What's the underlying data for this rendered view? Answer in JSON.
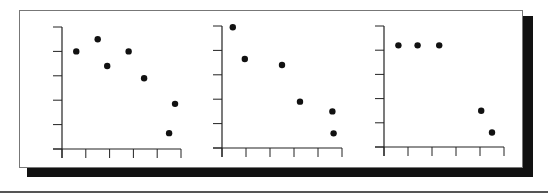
{
  "chart_data": [
    {
      "type": "scatter",
      "title": "",
      "xlabel": "",
      "ylabel": "",
      "xlim": [
        0,
        5
      ],
      "ylim": [
        0,
        5
      ],
      "x_ticks": [
        0,
        1,
        2,
        3,
        4,
        5
      ],
      "y_ticks": [
        0,
        1,
        2,
        3,
        4,
        5
      ],
      "tick_labels_shown": false,
      "grid": false,
      "points": [
        {
          "x": 0.6,
          "y": 4.0
        },
        {
          "x": 1.5,
          "y": 4.5
        },
        {
          "x": 1.9,
          "y": 3.4
        },
        {
          "x": 2.8,
          "y": 4.0
        },
        {
          "x": 3.45,
          "y": 2.9
        },
        {
          "x": 4.75,
          "y": 1.85
        },
        {
          "x": 4.5,
          "y": 0.65
        }
      ]
    },
    {
      "type": "scatter",
      "title": "",
      "xlabel": "",
      "ylabel": "",
      "xlim": [
        0,
        5
      ],
      "ylim": [
        0,
        5
      ],
      "x_ticks": [
        0,
        1,
        2,
        3,
        4,
        5
      ],
      "y_ticks": [
        0,
        1,
        2,
        3,
        4,
        5
      ],
      "tick_labels_shown": false,
      "grid": false,
      "points": [
        {
          "x": 0.45,
          "y": 4.95
        },
        {
          "x": 0.95,
          "y": 3.65
        },
        {
          "x": 2.5,
          "y": 3.4
        },
        {
          "x": 3.25,
          "y": 1.9
        },
        {
          "x": 4.6,
          "y": 1.5
        },
        {
          "x": 4.65,
          "y": 0.6
        }
      ]
    },
    {
      "type": "scatter",
      "title": "",
      "xlabel": "",
      "ylabel": "",
      "xlim": [
        0,
        5
      ],
      "ylim": [
        0,
        5
      ],
      "x_ticks": [
        0,
        1,
        2,
        3,
        4,
        5
      ],
      "y_ticks": [
        0,
        1,
        2,
        3,
        4,
        5
      ],
      "tick_labels_shown": false,
      "grid": false,
      "points": [
        {
          "x": 0.6,
          "y": 4.2
        },
        {
          "x": 1.4,
          "y": 4.2
        },
        {
          "x": 2.3,
          "y": 4.2
        },
        {
          "x": 4.05,
          "y": 1.5
        },
        {
          "x": 4.5,
          "y": 0.6
        }
      ]
    }
  ]
}
